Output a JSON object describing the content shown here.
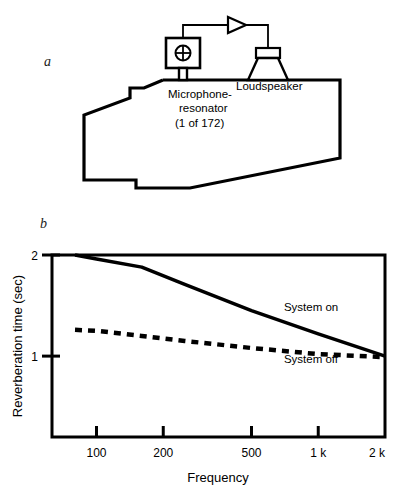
{
  "figure": {
    "panels": [
      {
        "id": "a",
        "label": "a",
        "kind": "schematic-diagram",
        "caption_labels": {
          "microphone": "Microphone-\nresonator\n(1 of 172)",
          "microphone_line1": "Microphone-",
          "microphone_line2": "resonator",
          "microphone_line3": "(1 of 172)",
          "loudspeaker": "Loudspeaker"
        },
        "components": [
          {
            "name": "microphone-resonator",
            "symbol": "circle-with-cross"
          },
          {
            "name": "amplifier",
            "symbol": "triangle-right"
          },
          {
            "name": "loudspeaker",
            "symbol": "speaker-cone"
          },
          {
            "name": "room-outline",
            "symbol": "irregular-polygon"
          }
        ]
      },
      {
        "id": "b",
        "label": "b",
        "kind": "chart"
      }
    ]
  },
  "chart_data": {
    "type": "line",
    "title": "",
    "xlabel": "Frequency",
    "ylabel": "Reverberation time (sec)",
    "xscale": "log",
    "xlim": [
      63,
      2000
    ],
    "ylim": [
      0.2,
      2.0
    ],
    "yticks": [
      1,
      2
    ],
    "ytick_labels": [
      "1",
      "2"
    ],
    "xticks": [
      100,
      200,
      500,
      1000,
      2000
    ],
    "xtick_labels": [
      "100",
      "200",
      "500",
      "1 k",
      "2 k"
    ],
    "grid": false,
    "legend_position": "inline-annotations",
    "series": [
      {
        "name": "System on",
        "style": "solid",
        "color": "#000000",
        "x": [
          80,
          100,
          160,
          250,
          500,
          1000,
          2000
        ],
        "y": [
          2.0,
          1.96,
          1.88,
          1.71,
          1.45,
          1.22,
          1.0
        ]
      },
      {
        "name": "System off",
        "style": "dashed",
        "color": "#000000",
        "x": [
          80,
          100,
          160,
          250,
          500,
          1000,
          2000
        ],
        "y": [
          1.26,
          1.25,
          1.2,
          1.15,
          1.08,
          1.02,
          0.99
        ]
      }
    ],
    "annotations": [
      {
        "text": "System on",
        "x": 700,
        "y": 1.45
      },
      {
        "text": "System off",
        "x": 700,
        "y": 0.93
      }
    ]
  }
}
